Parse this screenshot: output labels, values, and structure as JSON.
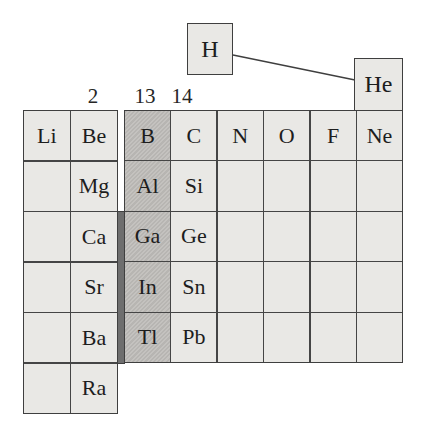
{
  "diagram": {
    "description_label": "periodic-table-fragment"
  },
  "colors": {
    "background": "#ffffff",
    "cell_fill": "#e9e8e5",
    "group13_fill": "#c2c0bc",
    "d_block_strip_fill": "#6e6e6e",
    "border": "#3f3f3f",
    "text": "#1d1d1d"
  },
  "hydrogen": {
    "symbol": "H"
  },
  "helium": {
    "symbol": "He"
  },
  "connector": {
    "from": "H",
    "to": "He"
  },
  "group_labels": [
    {
      "text": "2"
    },
    {
      "text": "13"
    },
    {
      "text": "14"
    }
  ],
  "left_block": {
    "columns": 2,
    "rows": [
      [
        "Li",
        "Be"
      ],
      [
        "",
        "Mg"
      ],
      [
        "",
        "Ca"
      ],
      [
        "",
        "Sr"
      ],
      [
        "",
        "Ba"
      ],
      [
        "",
        "Ra"
      ]
    ]
  },
  "right_block": {
    "columns": 6,
    "highlighted_column_index": 0,
    "rows": [
      [
        "B",
        "C",
        "N",
        "O",
        "F",
        "Ne"
      ],
      [
        "Al",
        "Si",
        "",
        "",
        "",
        ""
      ],
      [
        "Ga",
        "Ge",
        "",
        "",
        "",
        ""
      ],
      [
        "In",
        "Sn",
        "",
        "",
        "",
        ""
      ],
      [
        "Tl",
        "Pb",
        "",
        "",
        "",
        ""
      ]
    ]
  }
}
